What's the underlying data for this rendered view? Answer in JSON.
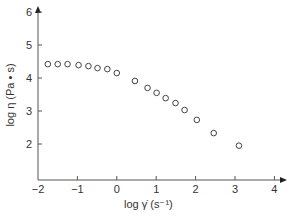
{
  "chart_data": {
    "type": "scatter",
    "title": "",
    "xlabel": "log γ̇ (s⁻¹)",
    "ylabel": "log η (Pa • s)",
    "xlim": [
      -2,
      4.4
    ],
    "ylim": [
      1,
      6
    ],
    "xticks": [
      -2,
      -1,
      0,
      1,
      2,
      3,
      4
    ],
    "yticks": [
      2,
      3,
      4,
      5,
      6
    ],
    "grid": false,
    "legend": null,
    "marker": "open-circle",
    "series": [
      {
        "name": "viscosity",
        "x": [
          -1.75,
          -1.5,
          -1.25,
          -0.97,
          -0.72,
          -0.49,
          -0.24,
          0.0,
          0.46,
          0.78,
          1.01,
          1.24,
          1.49,
          1.72,
          2.03,
          2.46,
          3.1
        ],
        "y": [
          4.42,
          4.42,
          4.42,
          4.39,
          4.36,
          4.3,
          4.27,
          4.15,
          3.91,
          3.7,
          3.55,
          3.39,
          3.24,
          3.03,
          2.73,
          2.33,
          1.95
        ]
      }
    ]
  }
}
